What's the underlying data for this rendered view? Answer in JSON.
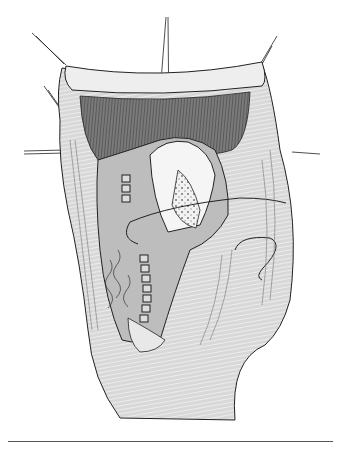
{
  "figure": {
    "kind": "surgical-illustration",
    "style": "black-and-white line drawing with gray shading",
    "colors": {
      "background": "#ffffff",
      "tissue_light": "#e4e4e4",
      "tissue_mid": "#c8c8c8",
      "muscle_dark": "#6a6a6a",
      "line": "#222222",
      "rule": "#555555"
    }
  }
}
